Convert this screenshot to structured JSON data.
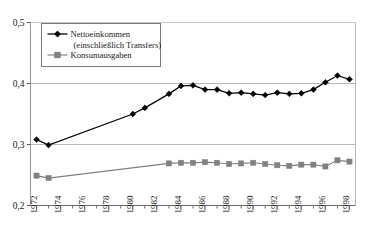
{
  "chart_data": {
    "type": "line",
    "title": "",
    "subtitle": "",
    "xlabel": "",
    "ylabel": "",
    "xlim": [
      1971.5,
      1998.5
    ],
    "ylim": [
      0.2,
      0.5
    ],
    "yticks": [
      0.2,
      0.3,
      0.4,
      0.5
    ],
    "ytick_labels": [
      "0,2",
      "0,3",
      "0,4",
      "0,5"
    ],
    "xticks": [
      1972,
      1973,
      1974,
      1975,
      1976,
      1977,
      1978,
      1979,
      1980,
      1981,
      1982,
      1983,
      1984,
      1985,
      1986,
      1987,
      1988,
      1989,
      1990,
      1991,
      1992,
      1993,
      1994,
      1995,
      1996,
      1997,
      1998
    ],
    "xtick_labels": [
      "1972",
      "1974",
      "1976",
      "1978",
      "1980",
      "1982",
      "1984",
      "1986",
      "1988",
      "1990",
      "1992",
      "1994",
      "1996",
      "1998"
    ],
    "xtick_labels_years": [
      1972,
      1974,
      1976,
      1978,
      1980,
      1982,
      1984,
      1986,
      1988,
      1990,
      1992,
      1994,
      1996,
      1998
    ],
    "xtick_labels_rotation": -90,
    "grid": "horizontal",
    "legend_position": "upper-left-inside",
    "series": [
      {
        "name": "Nettoeinkommen (einschließlich Transfers)",
        "marker": "diamond",
        "color": "#000000",
        "line_color": "#000000",
        "x": [
          1972,
          1973,
          1980,
          1981,
          1983,
          1984,
          1985,
          1986,
          1987,
          1988,
          1989,
          1990,
          1991,
          1992,
          1993,
          1994,
          1995,
          1996,
          1997,
          1998
        ],
        "values": [
          0.308,
          0.299,
          0.35,
          0.36,
          0.383,
          0.396,
          0.397,
          0.39,
          0.39,
          0.384,
          0.385,
          0.383,
          0.381,
          0.385,
          0.383,
          0.384,
          0.39,
          0.402,
          0.413,
          0.407
        ]
      },
      {
        "name": "Konsumausgaben",
        "marker": "square",
        "color": "#808080",
        "line_color": "#808080",
        "x": [
          1972,
          1973,
          1983,
          1984,
          1985,
          1986,
          1987,
          1988,
          1989,
          1990,
          1991,
          1992,
          1993,
          1994,
          1995,
          1996,
          1997,
          1998
        ],
        "values": [
          0.249,
          0.245,
          0.269,
          0.27,
          0.27,
          0.271,
          0.27,
          0.268,
          0.269,
          0.27,
          0.268,
          0.266,
          0.265,
          0.267,
          0.267,
          0.264,
          0.274,
          0.272
        ]
      }
    ],
    "legend": [
      {
        "label_line1": "Nettoeinkommen",
        "label_line2": "(einschließlich Transfers)",
        "marker": "diamond",
        "color": "#000000"
      },
      {
        "label_line1": "Konsumausgaben",
        "label_line2": "",
        "marker": "square",
        "color": "#808080"
      }
    ]
  }
}
